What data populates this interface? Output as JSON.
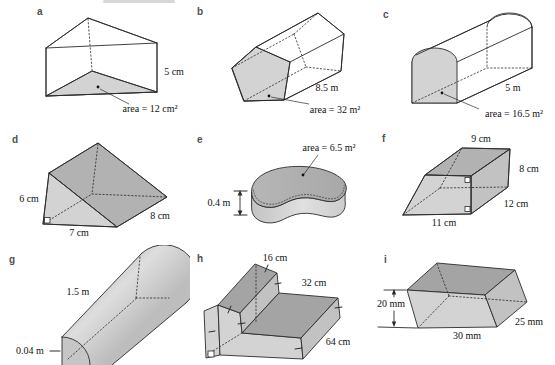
{
  "panels": {
    "a": {
      "letter": "a",
      "labels": {
        "height": "5 cm",
        "area": "area = 12 cm²"
      }
    },
    "b": {
      "letter": "b",
      "labels": {
        "length": "8.5 m",
        "area": "area = 32 m²"
      }
    },
    "c": {
      "letter": "c",
      "labels": {
        "length": "5 m",
        "area": "area = 16.5 m²"
      }
    },
    "d": {
      "letter": "d",
      "labels": {
        "height": "6 cm",
        "base": "7 cm",
        "depth": "8 cm"
      }
    },
    "e": {
      "letter": "e",
      "labels": {
        "area": "area = 6.5 m²",
        "thickness": "0.4 m"
      }
    },
    "f": {
      "letter": "f",
      "labels": {
        "top": "9 cm",
        "side": "8 cm",
        "depth": "12 cm",
        "base": "11 cm"
      }
    },
    "g": {
      "letter": "g",
      "labels": {
        "length": "1.5 m",
        "radius": "0.04 m"
      }
    },
    "h": {
      "letter": "h",
      "labels": {
        "top_width": "16 cm",
        "step_width": "32 cm",
        "length": "64 cm"
      }
    },
    "i": {
      "letter": "i",
      "labels": {
        "height": "20 mm",
        "base": "30 mm",
        "depth": "25 mm"
      }
    }
  },
  "colors": {
    "face_light": "#d3d3d3",
    "face_mid": "#c2c2c2",
    "face_dark2": "#b2b2b2",
    "face_dark": "#a4a4a4",
    "outline": "#2b2b2b",
    "label_text": "#111111",
    "panel_letter": "#4f4f4f",
    "leader_dot": "#111111"
  }
}
